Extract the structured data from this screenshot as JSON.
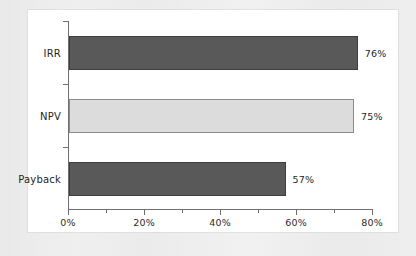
{
  "chart_data": {
    "type": "bar",
    "orientation": "horizontal",
    "title": "",
    "xlabel": "",
    "ylabel": "",
    "categories": [
      "IRR",
      "NPV",
      "Payback"
    ],
    "values": [
      76,
      75,
      57
    ],
    "value_labels": [
      "76%",
      "75%",
      "57%"
    ],
    "xlim": [
      0,
      80
    ],
    "xtick_labels": [
      "0%",
      "20%",
      "40%",
      "60%",
      "80%"
    ],
    "xtick_values": [
      0,
      20,
      40,
      60,
      80
    ],
    "xminor_tick_values": [
      10,
      30,
      50,
      70
    ],
    "grid": false,
    "legend": "none",
    "series": [
      {
        "name": "share of respondents",
        "points": [
          {
            "category": "IRR",
            "value": 76,
            "label": "76%",
            "color": "#595959"
          },
          {
            "category": "NPV",
            "value": 75,
            "label": "75%",
            "color": "#dcdcdc"
          },
          {
            "category": "Payback",
            "value": 57,
            "label": "57%",
            "color": "#595959"
          }
        ]
      }
    ],
    "colors": {
      "bar_dark": "#595959",
      "bar_dark_edge": "#3d3d3d",
      "bar_light": "#dcdcdc",
      "bar_light_edge": "#8a8a8a",
      "axis": "#6f6f6f",
      "text": "#1f1f1f",
      "panel": "#ffffff",
      "page": "#eeeeee"
    }
  }
}
